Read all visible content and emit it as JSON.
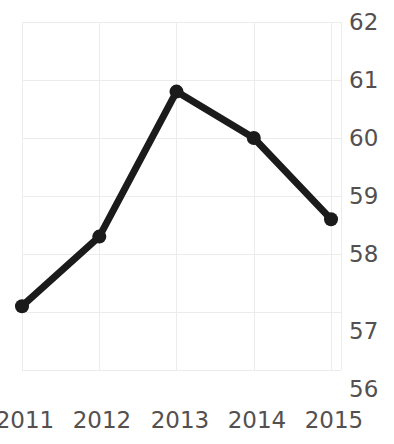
{
  "chart_data": {
    "type": "line",
    "title": "Median trend",
    "xlabel": "",
    "ylabel": "",
    "categories": [
      "2011",
      "2012",
      "2013",
      "2014",
      "2015"
    ],
    "x": [
      2011,
      2012,
      2013,
      2014,
      2015
    ],
    "values": [
      57.1,
      58.3,
      60.8,
      60.0,
      58.6
    ],
    "series": [
      {
        "name": "Median trend",
        "values": [
          57.1,
          58.3,
          60.8,
          60.0,
          58.6
        ]
      }
    ],
    "ylim": [
      56,
      62
    ],
    "yticks": [
      56,
      57,
      58,
      59,
      60,
      61,
      62
    ],
    "ytick_labels": [
      "56",
      "57",
      "58",
      "59",
      "60",
      "61",
      "62"
    ],
    "xtick_labels": [
      "2011",
      "2012",
      "2013",
      "2014",
      "2015"
    ],
    "grid": true,
    "grid_axis": "both",
    "legend": false,
    "legend_position": "none",
    "y_axis_position": "right",
    "markers": "circle",
    "annotations": []
  },
  "style": {
    "line_color": "#1b1b1b",
    "marker_color": "#1b1b1b",
    "grid_color": "#ececec",
    "tick_label_color": "#54504f",
    "title_color": "#231f20",
    "background": "#ffffff",
    "line_width_px": 7,
    "marker_radius_px": 7
  }
}
